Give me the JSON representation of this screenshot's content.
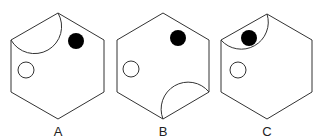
{
  "figure": {
    "options": [
      {
        "label": "A",
        "semicircle_position": "top-left-edge",
        "filled_circle": "upper-right inside hexagon",
        "hollow_circle": "left"
      },
      {
        "label": "B",
        "semicircle_position": "bottom-right-edge",
        "filled_circle": "upper-right",
        "hollow_circle": "left"
      },
      {
        "label": "C",
        "semicircle_position": "top-left-edge",
        "filled_circle": "inside semicircle",
        "hollow_circle": "left"
      }
    ]
  },
  "colors": {
    "stroke": "#333333",
    "fill_dark": "#000000",
    "background": "#ffffff"
  }
}
